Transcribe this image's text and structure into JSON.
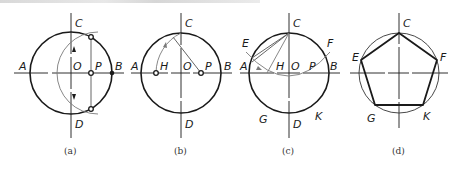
{
  "figure": {
    "panels": [
      {
        "id": "a",
        "caption": "(a)",
        "labels": {
          "A": "A",
          "B": "B",
          "C": "C",
          "D": "D",
          "O": "O",
          "P": "P"
        }
      },
      {
        "id": "b",
        "caption": "(b)",
        "labels": {
          "A": "A",
          "B": "B",
          "C": "C",
          "D": "D",
          "O": "O",
          "P": "P",
          "H": "H"
        }
      },
      {
        "id": "c",
        "caption": "(c)",
        "labels": {
          "A": "A",
          "B": "B",
          "C": "C",
          "D": "D",
          "O": "O",
          "P": "P",
          "H": "H",
          "E": "E",
          "F": "F",
          "G": "G",
          "K": "K"
        }
      },
      {
        "id": "d",
        "caption": "(d)",
        "labels": {
          "C": "C",
          "E": "E",
          "F": "F",
          "G": "G",
          "K": "K"
        }
      }
    ]
  },
  "colors": {
    "stroke": "#1a1a1a",
    "construction": "#7a7a7a",
    "background": "#ffffff"
  }
}
